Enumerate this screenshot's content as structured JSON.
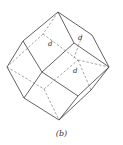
{
  "figure": {
    "caption": "(b)",
    "labels": [
      {
        "text": "d",
        "x": 50,
        "y": 46
      },
      {
        "text": "d",
        "x": 79,
        "y": 40
      },
      {
        "text": "d",
        "x": 74,
        "y": 72
      }
    ],
    "colors": {
      "line": "#3a3a3a",
      "hidden": "#6a6a6a",
      "background": "#ffffff"
    }
  }
}
